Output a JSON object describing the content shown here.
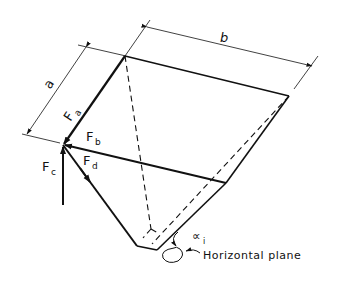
{
  "figure": {
    "labels": {
      "dim_a": "a",
      "dim_b": "b",
      "force_a": "F",
      "force_a_sub": "a",
      "force_b": "F",
      "force_b_sub": "b",
      "force_c": "F",
      "force_c_sub": "c",
      "force_d": "F",
      "force_d_sub": "d",
      "angle": "∝",
      "angle_sub": "i",
      "plane_label": "Horizontal plane"
    },
    "colors": {
      "line": "#111111",
      "background": "#ffffff"
    }
  }
}
